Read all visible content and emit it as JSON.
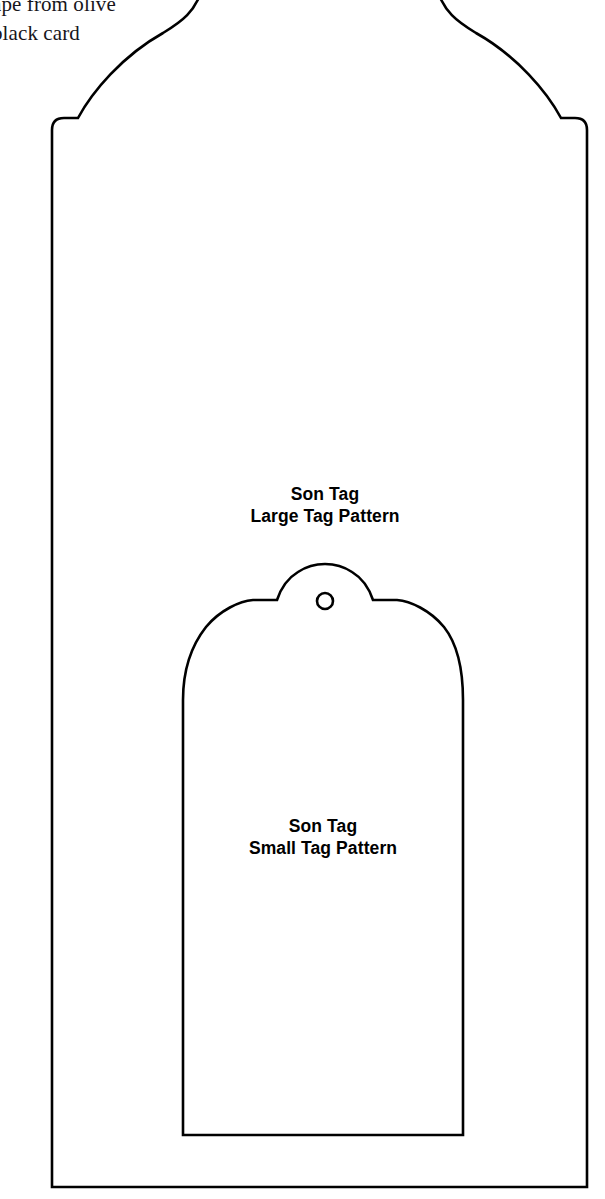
{
  "page": {
    "background_color": "#ffffff",
    "ink_color": "#000000",
    "width": 605,
    "height": 1199,
    "document_type": "sewing-pattern-template"
  },
  "note": {
    "text": "ape from olive\nblack card",
    "note_color": "#17151a",
    "cropped": true
  },
  "large_tag": {
    "label_line_1": "Son Tag",
    "label_line_2": "Large Tag Pattern",
    "stroke_color": "#000000",
    "stroke_width": 2.6,
    "fill": "none"
  },
  "small_tag": {
    "label_line_1": "Son Tag",
    "label_line_2": "Small Tag Pattern",
    "stroke_color": "#000000",
    "stroke_width": 2.6,
    "fill": "none",
    "hole": {
      "center_x": 325,
      "center_y": 601,
      "radius": 8,
      "stroke_width": 2.6
    }
  }
}
